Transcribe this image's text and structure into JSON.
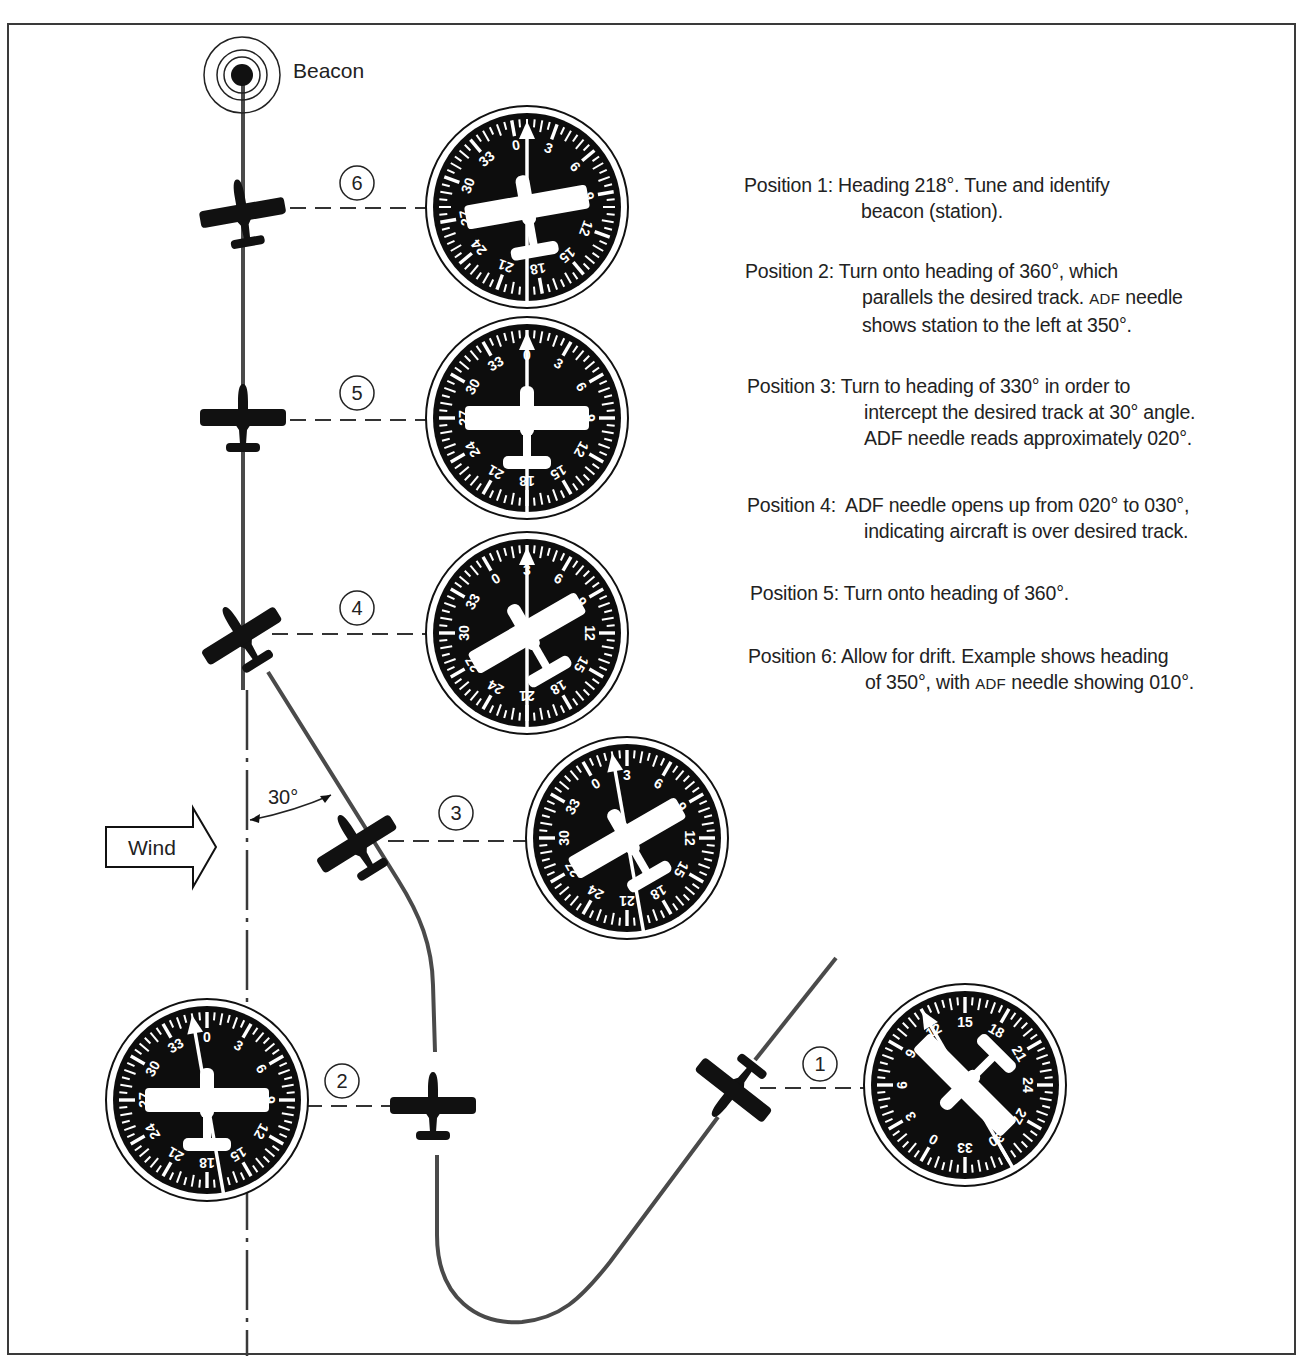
{
  "beacon": {
    "label": "Beacon",
    "icon": "beacon-icon"
  },
  "wind": {
    "label": "Wind",
    "icon": "wind-arrow-icon"
  },
  "angle_annotation": {
    "label": "30°"
  },
  "positions": [
    {
      "number": "1",
      "heading": "218°"
    },
    {
      "number": "2",
      "heading": "360°"
    },
    {
      "number": "3",
      "heading": "330°"
    },
    {
      "number": "4",
      "heading": "330°"
    },
    {
      "number": "5",
      "heading": "360°"
    },
    {
      "number": "6",
      "heading": "350°"
    }
  ],
  "notes": [
    {
      "label": "Position 1:",
      "lines": [
        "Heading 218°. Tune and identify",
        "beacon (station)."
      ]
    },
    {
      "label": "Position 2:",
      "lines": [
        "Turn onto heading of 360°, which",
        "parallels the desired track. ",
        "shows station to the left at 350°."
      ],
      "smallcaps": "ADF",
      "line2_tail": " needle"
    },
    {
      "label": "Position 3:",
      "lines": [
        "Turn to heading of 330° in order to",
        "intercept the desired track at 30° angle.",
        "ADF needle reads approximately 020°."
      ]
    },
    {
      "label": "Position 4:",
      "lines": [
        "ADF needle opens up from 020° to 030°,",
        "indicating aircraft is over desired track."
      ]
    },
    {
      "label": "Position 5:",
      "lines": [
        "Turn onto heading of 360°."
      ]
    },
    {
      "label": "Position 6:",
      "lines": [
        "Allow for drift. Example shows heading",
        "of 350°, with ",
        " needle showing 010°."
      ],
      "smallcaps": "ADF"
    }
  ],
  "dial_labels": [
    "0",
    "3",
    "6",
    "9",
    "12",
    "15",
    "18",
    "21",
    "24",
    "27",
    "30",
    "33"
  ],
  "dials": [
    {
      "id": "dial-1",
      "position": "1",
      "cx": 965,
      "cy": 1085,
      "card_rotation": -150,
      "plane_rotation": -135,
      "needle_rotation": -30
    },
    {
      "id": "dial-2",
      "position": "2",
      "cx": 207,
      "cy": 1100,
      "card_rotation": 0,
      "plane_rotation": 0,
      "needle_rotation": -10
    },
    {
      "id": "dial-3",
      "position": "3",
      "cx": 627,
      "cy": 838,
      "card_rotation": -30,
      "plane_rotation": -30,
      "needle_rotation": -10
    },
    {
      "id": "dial-4",
      "position": "4",
      "cx": 527,
      "cy": 633,
      "card_rotation": -30,
      "plane_rotation": -30,
      "needle_rotation": 0
    },
    {
      "id": "dial-5",
      "position": "5",
      "cx": 527,
      "cy": 418,
      "card_rotation": 0,
      "plane_rotation": 0,
      "needle_rotation": 0
    },
    {
      "id": "dial-6",
      "position": "6",
      "cx": 527,
      "cy": 207,
      "card_rotation": -10,
      "plane_rotation": -10,
      "needle_rotation": 0
    }
  ],
  "colors": {
    "ink": "#111111",
    "track": "#4a4a4a",
    "dial_face": "#0d0d0d",
    "paper": "#ffffff"
  }
}
